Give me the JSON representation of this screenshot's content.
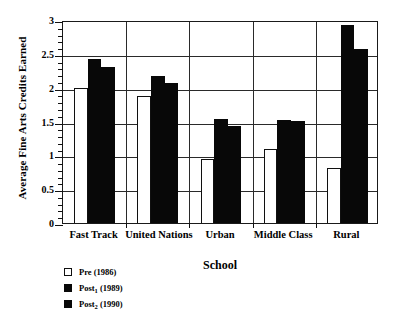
{
  "chart_data": {
    "type": "bar",
    "title": "",
    "xlabel": "School",
    "ylabel": "Average Fine Arts Credits Earned",
    "ylim": [
      0,
      3
    ],
    "ytick_labels": [
      "0",
      "0.5",
      "1",
      "1.5",
      "2",
      "2.5",
      "3"
    ],
    "ytick_values": [
      0,
      0.5,
      1,
      1.5,
      2,
      2.5,
      3
    ],
    "minor_tick_step": 0.1,
    "grid": "horizontal-and-group-separators",
    "legend_position": "below-left",
    "categories": [
      "Fast Track",
      "United Nations",
      "Urban",
      "Middle Class",
      "Rural"
    ],
    "series": [
      {
        "name": "Pre (1986)",
        "label_main": "Pre (1986)",
        "fill": "#ffffff",
        "edge": "#101010",
        "values": [
          2.0,
          1.88,
          0.95,
          1.09,
          0.82
        ]
      },
      {
        "name": "Post1 (1989)",
        "label_prefix": "Post",
        "label_subscript": "1",
        "label_suffix": " (1989)",
        "fill": "#080808",
        "edge": "#080808",
        "values": [
          2.43,
          2.17,
          1.53,
          1.52,
          2.92
        ]
      },
      {
        "name": "Post2 (1990)",
        "label_prefix": "Post",
        "label_subscript": "2",
        "label_suffix": " (1990)",
        "fill": "#080808",
        "edge": "#080808",
        "values": [
          2.31,
          2.07,
          1.43,
          1.51,
          2.57
        ]
      }
    ]
  }
}
